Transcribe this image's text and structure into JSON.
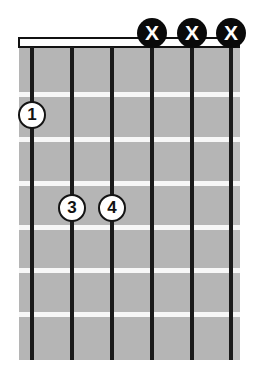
{
  "diagram": {
    "type": "guitar-chord-diagram",
    "orientation": "vertical",
    "string_count": 6,
    "fret_count": 7,
    "colors": {
      "fretboard": "#b5b5b5",
      "fret_line": "#f7f7f7",
      "string": "#1a1a1a",
      "nut_fill": "#fdfdfd",
      "nut_border": "#111111",
      "mute_marker_fill": "#0a0a0a",
      "mute_marker_text": "#ffffff",
      "finger_dot_fill": "#ffffff",
      "finger_dot_border": "#141414",
      "background": "#ffffff"
    },
    "strings": [
      {
        "index": 1,
        "x": 32
      },
      {
        "index": 2,
        "x": 72
      },
      {
        "index": 3,
        "x": 112
      },
      {
        "index": 4,
        "x": 152
      },
      {
        "index": 5,
        "x": 192
      },
      {
        "index": 6,
        "x": 231
      }
    ],
    "frets": [
      {
        "index": 1,
        "y": 92
      },
      {
        "index": 2,
        "y": 137
      },
      {
        "index": 3,
        "y": 181
      },
      {
        "index": 4,
        "y": 225
      },
      {
        "index": 5,
        "y": 268
      },
      {
        "index": 6,
        "y": 312
      }
    ],
    "nut": {
      "x": 18,
      "y": 37,
      "width": 222,
      "height": 11
    },
    "board": {
      "x": 19,
      "y": 47,
      "width": 221,
      "height": 313
    },
    "mute_markers": [
      {
        "label": "X",
        "string": 4,
        "x": 152,
        "y": 33
      },
      {
        "label": "X",
        "string": 5,
        "x": 192,
        "y": 33
      },
      {
        "label": "X",
        "string": 6,
        "x": 231,
        "y": 33
      }
    ],
    "finger_dots": [
      {
        "label": "1",
        "string": 1,
        "fret": 2,
        "x": 32,
        "y": 115
      },
      {
        "label": "3",
        "string": 2,
        "fret": 4,
        "x": 72,
        "y": 208
      },
      {
        "label": "4",
        "string": 3,
        "fret": 4,
        "x": 112,
        "y": 208
      }
    ]
  }
}
